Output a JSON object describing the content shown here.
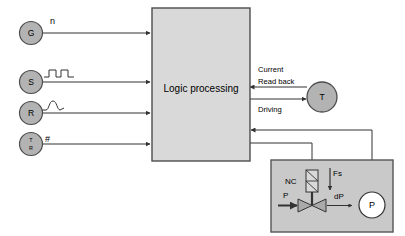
{
  "diagram": {
    "colors": {
      "node_fill": "#b3b3b3",
      "node_stroke": "#4d4d4d",
      "block_fill": "#d9d9d9",
      "block_stroke": "#4d4d4d",
      "panel_fill": "#c9c9c9",
      "panel_stroke": "#555555",
      "line": "#333333",
      "text": "#000000",
      "gauge_fill": "#ffffff",
      "valve_fill": "#aaaaaa"
    }
  },
  "inputs": [
    {
      "id": "g",
      "node_label": "G",
      "signal_label": "n",
      "icon": "none",
      "icon_name": "speed-signal-icon"
    },
    {
      "id": "s",
      "node_label": "S",
      "signal_label": "",
      "icon": "square-wave",
      "icon_name": "square-wave-icon"
    },
    {
      "id": "r",
      "node_label": "R",
      "signal_label": "",
      "icon": "bell-pulse",
      "icon_name": "bell-pulse-icon"
    },
    {
      "id": "tr",
      "node_label_top": "T",
      "node_label_bottom": "R",
      "signal_label": "#",
      "icon": "none",
      "icon_name": "hash-signal-icon"
    }
  ],
  "logic_block": {
    "label": "Logic processing"
  },
  "actuator": {
    "node_label": "T",
    "feedback_label_line1": "Current",
    "feedback_label_line2": "Read back",
    "drive_label": "Driving"
  },
  "valve_panel": {
    "coil_label": "NC",
    "inlet_label": "P",
    "outlet_label": "dP",
    "spring_label": "Fs",
    "gauge_label": "P"
  }
}
